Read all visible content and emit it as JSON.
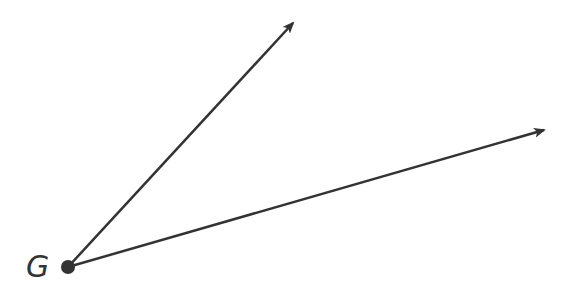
{
  "diagram": {
    "stroke_color": "#333333",
    "vertex": {
      "label": "G",
      "x": 68,
      "y": 267,
      "radius": 7
    },
    "rays": [
      {
        "name": "upper-ray",
        "x2": 293,
        "y2": 23
      },
      {
        "name": "lower-ray",
        "x2": 544,
        "y2": 130
      }
    ]
  }
}
